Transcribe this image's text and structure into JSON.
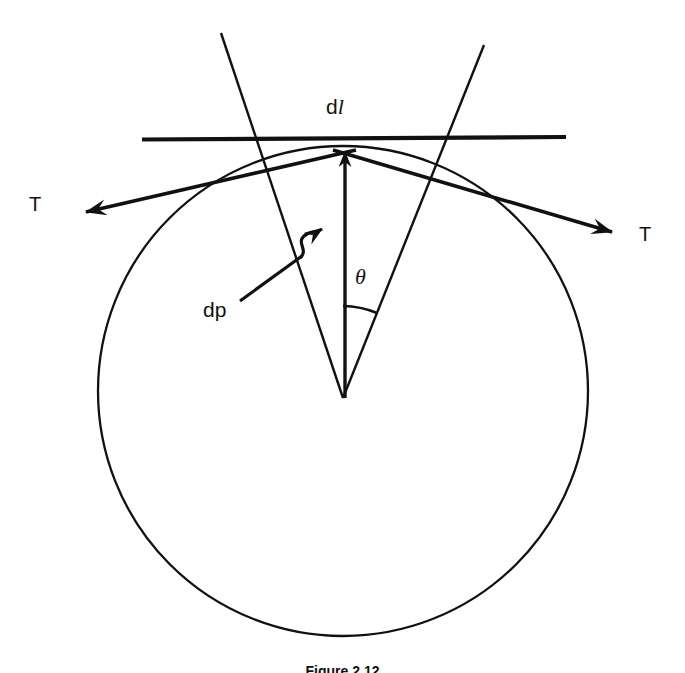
{
  "figure": {
    "kind": "diagram",
    "title_visible": false,
    "background_color": "#ffffff",
    "stroke_color": "#111111",
    "caption": "Figure 2.12",
    "caption_clipped": true,
    "labels": {
      "arc_length": "d",
      "arc_length_italic": "l",
      "arc_length_full": "dl",
      "angle": "θ",
      "pressure": "dp",
      "tension_left": "T",
      "tension_right": "T"
    },
    "geometry": {
      "circle": {
        "center_x": 343,
        "center_y": 391,
        "radius": 245,
        "left_x": 98,
        "right_x": 588,
        "top_y": 146,
        "bottom_y": 636,
        "stroke_width": 2.2
      },
      "tangent_line": {
        "x1": 142,
        "y1": 139,
        "x2": 566,
        "y2": 137,
        "stroke_width": 4
      },
      "radius_left": {
        "from_x": 343,
        "from_y": 398,
        "to_x": 221,
        "to_y": 33
      },
      "radius_right": {
        "from_x": 343,
        "from_y": 398,
        "to_x": 484,
        "to_y": 45
      },
      "radial_arrow": {
        "from_x": 345,
        "from_y": 398,
        "to_x": 345,
        "to_y": 145
      },
      "angle_arc": {
        "center_x": 343,
        "center_y": 398,
        "radius": 92,
        "start_deg": 90,
        "end_deg": 68
      },
      "tension_arrow_left": {
        "from_x": 356,
        "from_y": 150,
        "to_x": 80,
        "to_y": 214
      },
      "tension_arrow_right": {
        "from_x": 335,
        "from_y": 150,
        "to_x": 618,
        "to_y": 234
      },
      "dp_leader": {
        "from_x": 240,
        "from_y": 300,
        "to_x": 336,
        "to_y": 230,
        "has_squiggle": true
      }
    }
  }
}
